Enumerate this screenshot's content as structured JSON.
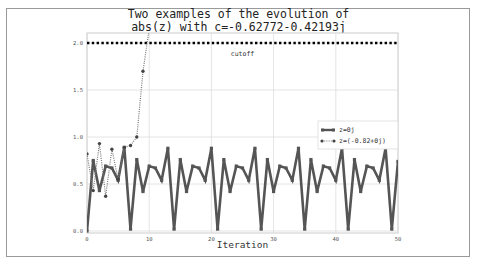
{
  "chart_data": {
    "type": "line",
    "title": "Two examples of the evolution of abs(z) with c=-0.62772-0.42193j",
    "title_lines": [
      "Two examples of the evolution of",
      "abs(z) with c=-0.62772-0.42193j"
    ],
    "xlabel": "Iteration",
    "ylabel": "",
    "xlim": [
      0,
      50
    ],
    "ylim": [
      0,
      2.1
    ],
    "xticks": [
      0,
      10,
      20,
      30,
      40,
      50
    ],
    "yticks": [
      0.0,
      0.5,
      1.0,
      1.5,
      2.0
    ],
    "ytick_labels": [
      "0.0",
      "0.5",
      "1.0",
      "1.5",
      "2.0"
    ],
    "grid": true,
    "legend_position": "center right",
    "annotations": [
      {
        "text": "cutoff",
        "x": 25,
        "y": 1.92
      }
    ],
    "hlines": [
      {
        "name": "cutoff",
        "y": 2.0,
        "style": "dotted",
        "color": "#000000"
      }
    ],
    "series": [
      {
        "name": "z=0j",
        "style": "solid",
        "color": "#555555",
        "x": [
          0,
          1,
          2,
          3,
          4,
          5,
          6,
          7,
          8,
          9,
          10,
          11,
          12,
          13,
          14,
          15,
          16,
          17,
          18,
          19,
          20,
          21,
          22,
          23,
          24,
          25,
          26,
          27,
          28,
          29,
          30,
          31,
          32,
          33,
          34,
          35,
          36,
          37,
          38,
          39,
          40,
          41,
          42,
          43,
          44,
          45,
          46,
          47,
          48,
          49,
          50
        ],
        "values": [
          0.0,
          0.75,
          0.43,
          0.69,
          0.67,
          0.54,
          0.89,
          0.02,
          0.76,
          0.42,
          0.69,
          0.67,
          0.54,
          0.88,
          0.02,
          0.76,
          0.42,
          0.69,
          0.67,
          0.54,
          0.88,
          0.02,
          0.76,
          0.42,
          0.69,
          0.67,
          0.54,
          0.88,
          0.02,
          0.76,
          0.42,
          0.69,
          0.67,
          0.54,
          0.88,
          0.02,
          0.76,
          0.42,
          0.69,
          0.67,
          0.54,
          0.88,
          0.02,
          0.76,
          0.42,
          0.69,
          0.67,
          0.54,
          0.88,
          0.02,
          0.74
        ]
      },
      {
        "name": "z=(-0.82+0j)",
        "style": "dotted",
        "color": "#555555",
        "x": [
          0,
          1,
          2,
          3,
          4,
          5,
          6,
          7,
          8,
          9,
          10
        ],
        "values": [
          0.82,
          0.43,
          0.93,
          0.37,
          0.87,
          0.55,
          0.89,
          0.91,
          1.0,
          1.7,
          2.15
        ]
      }
    ]
  }
}
